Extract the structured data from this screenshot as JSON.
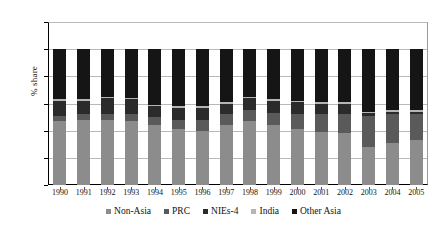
{
  "chart_data": {
    "type": "bar",
    "subtype": "stacked-100",
    "title": "",
    "xlabel": "",
    "ylabel": "% share",
    "ylim": [
      0,
      120
    ],
    "yticks": [
      0,
      20,
      40,
      60,
      80,
      100,
      120
    ],
    "grid": true,
    "legend_position": "bottom",
    "categories": [
      "1990",
      "1991",
      "1992",
      "1993",
      "1994",
      "1995",
      "1996",
      "1997",
      "1998",
      "1999",
      "2000",
      "2001",
      "2002",
      "2003",
      "2004",
      "2005"
    ],
    "series": [
      {
        "name": "Non-Asia",
        "color": "#8c8c8c",
        "values": [
          47,
          48,
          48,
          47,
          44,
          41,
          40,
          44,
          47,
          44,
          41,
          39,
          38,
          28,
          31,
          33
        ]
      },
      {
        "name": "PRC",
        "color": "#5a5a5a",
        "values": [
          4,
          4,
          4,
          5,
          6,
          7,
          8,
          8,
          8,
          9,
          11,
          13,
          14,
          23,
          21,
          19
        ]
      },
      {
        "name": "NIEs-4",
        "color": "#2b2b2b",
        "values": [
          11,
          10,
          12,
          11,
          8,
          9,
          9,
          8,
          9,
          9,
          9,
          8,
          8,
          2,
          2,
          2
        ]
      },
      {
        "name": "India",
        "color": "#b5b5b5",
        "values": [
          1,
          1,
          1,
          1,
          1,
          1,
          1,
          1,
          1,
          1,
          1,
          1,
          1,
          1,
          1,
          1
        ]
      },
      {
        "name": "Other Asia",
        "color": "#151515",
        "values": [
          37,
          37,
          35,
          36,
          41,
          42,
          42,
          39,
          35,
          37,
          38,
          39,
          39,
          46,
          45,
          45
        ]
      }
    ]
  },
  "axes": {
    "y_title": "% share",
    "y_tick_labels": [
      "0",
      "20",
      "40",
      "60",
      "80",
      "100",
      "120"
    ]
  },
  "legend": {
    "items": [
      {
        "label": "Non-Asia"
      },
      {
        "label": "PRC"
      },
      {
        "label": "NIEs-4"
      },
      {
        "label": "India"
      },
      {
        "label": "Other Asia"
      }
    ]
  }
}
